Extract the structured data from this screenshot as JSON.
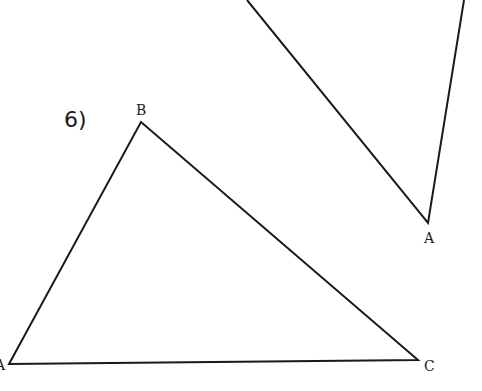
{
  "problem": {
    "number_label": "6)"
  },
  "triangle_main": {
    "vertices": [
      {
        "name": "A",
        "x": 9,
        "y": 364,
        "label": "A"
      },
      {
        "name": "B",
        "x": 141,
        "y": 122,
        "label": "B"
      },
      {
        "name": "C",
        "x": 418,
        "y": 360,
        "label": "C"
      }
    ]
  },
  "triangle_upper_partial": {
    "vertices": [
      {
        "name": "A",
        "x": 428,
        "y": 223,
        "label": "A"
      }
    ],
    "edges_from_top": [
      {
        "from_x": 247,
        "from_y": 0
      },
      {
        "from_x": 464,
        "from_y": 0
      }
    ]
  },
  "colors": {
    "stroke": "#1a1a1a",
    "background": "#ffffff"
  }
}
